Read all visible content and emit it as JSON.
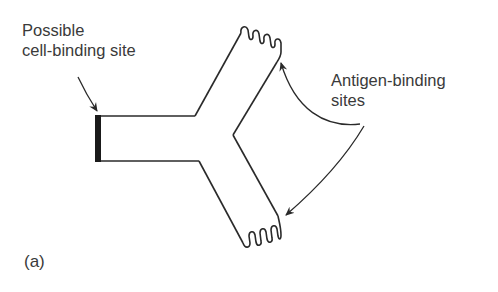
{
  "diagram": {
    "labels": {
      "cell_binding": [
        "Possible",
        "cell-binding site"
      ],
      "antigen_binding": [
        "Antigen-binding",
        "sites"
      ],
      "panel": "(a)"
    },
    "colors": {
      "line": "#2a2a2a",
      "text": "#3a3a3a",
      "background": "#ffffff"
    },
    "parts": [
      {
        "name": "stem",
        "description": "Fc stem with dark cell-binding end"
      },
      {
        "name": "upper-arm",
        "description": "Fab arm with wavy antigen-binding tip"
      },
      {
        "name": "lower-arm",
        "description": "Fab arm with wavy antigen-binding tip"
      }
    ]
  }
}
